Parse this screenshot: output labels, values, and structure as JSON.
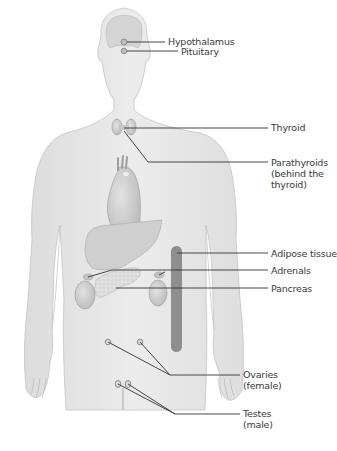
{
  "diagram": {
    "type": "anatomy-endocrine-glands",
    "colors": {
      "body_fill": "#e6e6e6",
      "body_stroke": "#b5b5b5",
      "organ_fill": "#d2d2d2",
      "organ_dark": "#a8a8a8",
      "adipose": "#8d8d8d",
      "leader_line": "#333333",
      "label_text": "#3a3a3a"
    },
    "labels": [
      {
        "id": "hypothalamus",
        "text": "Hypothalamus"
      },
      {
        "id": "pituitary",
        "text": "Pituitary"
      },
      {
        "id": "thyroid",
        "text": "Thyroid"
      },
      {
        "id": "parathyroids",
        "text": "Parathyroids\n(behind the\nthyroid)"
      },
      {
        "id": "adipose",
        "text": "Adipose tissue"
      },
      {
        "id": "adrenals",
        "text": "Adrenals"
      },
      {
        "id": "pancreas",
        "text": "Pancreas"
      },
      {
        "id": "ovaries",
        "text": "Ovaries\n(female)"
      },
      {
        "id": "testes",
        "text": "Testes\n(male)"
      }
    ]
  }
}
